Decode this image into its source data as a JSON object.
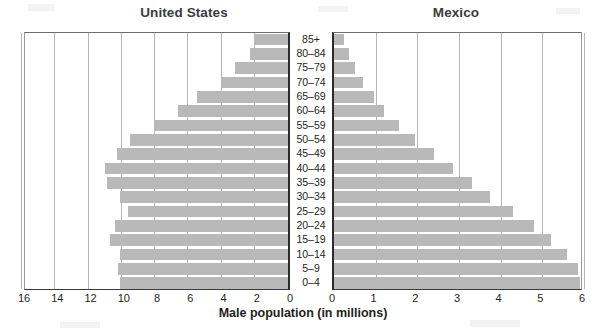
{
  "chart_data": {
    "type": "bar",
    "title": "Male population (in millions)",
    "subtitle": "",
    "xlabel": "Male population (in millions)",
    "ylabel": "",
    "orientation": "horizontal",
    "layout": "population-pyramid-two-panel",
    "grid": true,
    "legend": "none",
    "categories": [
      "85+",
      "80–84",
      "75–79",
      "70–74",
      "65–69",
      "60–64",
      "55–59",
      "50–54",
      "45–49",
      "40–44",
      "35–39",
      "30–34",
      "25–29",
      "20–24",
      "15–19",
      "10–14",
      "5–9",
      "0–4"
    ],
    "panels": [
      {
        "name": "United States",
        "side": "left",
        "axis_direction": "right-to-left",
        "xlim": [
          0,
          16
        ],
        "ticks": [
          16,
          14,
          12,
          10,
          8,
          6,
          4,
          2,
          0
        ],
        "values": [
          2.0,
          2.3,
          3.2,
          4.0,
          5.5,
          6.6,
          8.0,
          9.5,
          10.3,
          11.0,
          10.9,
          10.1,
          9.6,
          10.4,
          10.7,
          10.1,
          10.2,
          10.1
        ]
      },
      {
        "name": "Mexico",
        "side": "right",
        "axis_direction": "left-to-right",
        "xlim": [
          0,
          6
        ],
        "ticks": [
          0,
          1,
          2,
          3,
          4,
          5,
          6
        ],
        "values": [
          0.25,
          0.35,
          0.5,
          0.7,
          0.95,
          1.2,
          1.55,
          1.95,
          2.4,
          2.85,
          3.3,
          3.75,
          4.3,
          4.8,
          5.2,
          5.6,
          5.85,
          5.9
        ]
      }
    ]
  },
  "titles": {
    "left": "United States",
    "right": "Mexico"
  },
  "axis": {
    "xlabel": "Male population (in millions)",
    "left_ticks": [
      "16",
      "14",
      "12",
      "10",
      "8",
      "6",
      "4",
      "2",
      "0"
    ],
    "right_ticks": [
      "0",
      "1",
      "2",
      "3",
      "4",
      "5",
      "6"
    ]
  },
  "colors": {
    "bar": "#b9b9b9",
    "grid": "#b5b5b5",
    "axis": "#2b2b2b",
    "text": "#231f20",
    "title": "#3b3b3b",
    "background": "#ffffff"
  }
}
